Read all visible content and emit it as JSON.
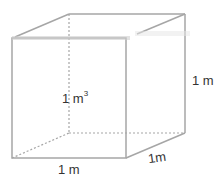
{
  "diagram": {
    "type": "cube",
    "colors": {
      "edge": "#a6a6a6",
      "hidden_edge": "#a6a6a6",
      "text": "#333333"
    },
    "labels": {
      "volume_value": "1 m",
      "volume_exponent": "3",
      "width": "1 m",
      "depth": "1m",
      "height": "1 m"
    }
  }
}
